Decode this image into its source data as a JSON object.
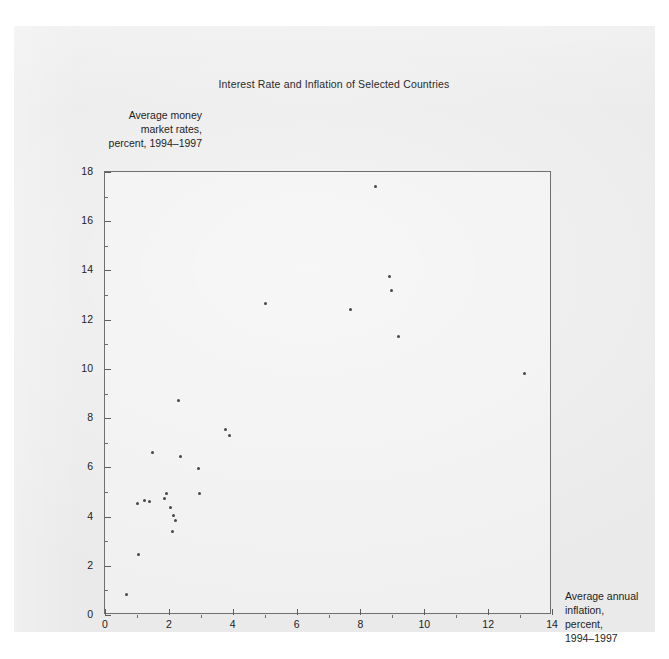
{
  "figure": {
    "title": "Interest Rate and Inflation of Selected Countries",
    "y_axis_title_lines": [
      "Average money",
      "market rates,",
      "percent, 1994–1997"
    ],
    "x_axis_title_lines": [
      "Average annual",
      "inflation,",
      "percent,",
      "1994–1997"
    ],
    "source_mark": "Sec. 93"
  },
  "colors": {
    "page_background": "#ffffff",
    "paper_background": "#eaeaea",
    "axis_line": "#6f6f6f",
    "tick_label": "#232323",
    "marker": "#474747",
    "title_text": "#2a2a2a"
  },
  "chart_data": {
    "type": "scatter",
    "title": "Interest Rate and Inflation of Selected Countries",
    "xlabel": "Average annual inflation, percent, 1994–1997",
    "ylabel": "Average money market rates, percent, 1994–1997",
    "xlim": [
      0,
      14
    ],
    "ylim": [
      0,
      18
    ],
    "xticks": [
      0,
      2,
      4,
      6,
      8,
      10,
      12,
      14
    ],
    "xticklabels": [
      "0",
      "2",
      "4",
      "6",
      "8",
      "10",
      "12",
      "14"
    ],
    "x_minor_ticks": [
      1,
      3,
      5,
      7,
      9,
      11,
      13
    ],
    "yticks": [
      0,
      2,
      4,
      6,
      8,
      10,
      12,
      14,
      16,
      18
    ],
    "yticklabels": [
      "0",
      "2",
      "4",
      "6",
      "8",
      "10",
      "12",
      "14",
      "16",
      "18"
    ],
    "y_minor_ticks": [
      1,
      3,
      5,
      7,
      9,
      11,
      13,
      15,
      17
    ],
    "grid": false,
    "legend": "none",
    "marker": "filled-circle",
    "points": [
      {
        "x": 0.66,
        "y": 0.85
      },
      {
        "x": 1.06,
        "y": 2.45
      },
      {
        "x": 1.02,
        "y": 4.55
      },
      {
        "x": 1.25,
        "y": 4.65
      },
      {
        "x": 1.4,
        "y": 4.6
      },
      {
        "x": 1.49,
        "y": 6.6
      },
      {
        "x": 1.85,
        "y": 4.75
      },
      {
        "x": 1.92,
        "y": 4.95
      },
      {
        "x": 2.05,
        "y": 4.35
      },
      {
        "x": 2.1,
        "y": 3.4
      },
      {
        "x": 2.15,
        "y": 4.05
      },
      {
        "x": 2.22,
        "y": 3.85
      },
      {
        "x": 2.3,
        "y": 8.7
      },
      {
        "x": 2.38,
        "y": 6.45
      },
      {
        "x": 2.92,
        "y": 5.95
      },
      {
        "x": 2.95,
        "y": 4.95
      },
      {
        "x": 3.77,
        "y": 7.55
      },
      {
        "x": 3.91,
        "y": 7.3
      },
      {
        "x": 5.03,
        "y": 12.65
      },
      {
        "x": 7.69,
        "y": 12.4
      },
      {
        "x": 8.48,
        "y": 17.4
      },
      {
        "x": 8.9,
        "y": 13.75
      },
      {
        "x": 8.96,
        "y": 13.2
      },
      {
        "x": 9.18,
        "y": 11.3
      },
      {
        "x": 13.15,
        "y": 9.8
      }
    ]
  }
}
